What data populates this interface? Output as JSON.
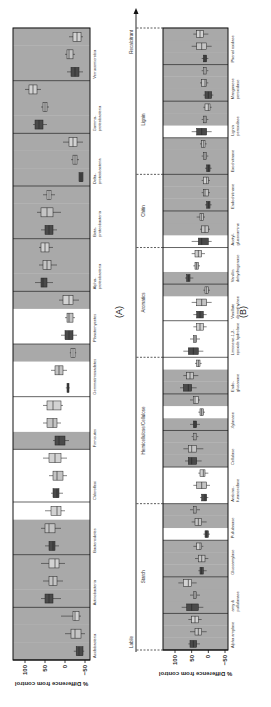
{
  "figure": {
    "panel_a_label": "(A)",
    "panel_b_label": "(B)",
    "gradient": {
      "low_label": "Labile",
      "high_label": "Recalcitrant"
    }
  },
  "colors": {
    "shaded_bg": "#a9a9a9",
    "unshaded_bg": "#ffffff",
    "treatment_1": "#4a4a4a",
    "treatment_2": "#c4c4c4",
    "treatment_3": "#d2d2d2"
  },
  "chart_data": [
    {
      "type": "box",
      "panel": "A",
      "ylabel": "% Difference from control",
      "ylim": [
        -60,
        110
      ],
      "yticks": [
        100,
        50,
        0,
        -50
      ],
      "ytick_labels": [
        "100",
        "50",
        "0",
        "−50"
      ],
      "categories": [
        {
          "label": "Acidobacteria",
          "shade": [
            1,
            1,
            1
          ],
          "boxes": [
            [
              -35,
              -45,
              -28,
              -48,
              -22
            ],
            [
              -25,
              -40,
              -15,
              -50,
              0
            ],
            [
              -25,
              -35,
              -20,
              -40,
              10
            ]
          ]
        },
        {
          "label": "Actinobacteria",
          "shade": [
            1,
            1,
            1
          ],
          "boxes": [
            [
              40,
              30,
              50,
              10,
              60
            ],
            [
              30,
              20,
              40,
              5,
              55
            ],
            [
              25,
              15,
              40,
              0,
              60
            ]
          ]
        },
        {
          "label": "Bacteroidetes",
          "shade": [
            1,
            1,
            0
          ],
          "boxes": [
            [
              30,
              25,
              40,
              15,
              50
            ],
            [
              40,
              25,
              50,
              10,
              60
            ],
            [
              20,
              10,
              35,
              0,
              50
            ]
          ]
        },
        {
          "label": "Chloroflexi",
          "shade": [
            0,
            0,
            0
          ],
          "boxes": [
            [
              20,
              15,
              30,
              5,
              35
            ],
            [
              20,
              5,
              30,
              -5,
              40
            ],
            [
              25,
              10,
              40,
              -5,
              55
            ]
          ]
        },
        {
          "label": "Firmicutes",
          "shade": [
            1,
            0,
            0
          ],
          "boxes": [
            [
              15,
              0,
              25,
              -10,
              30
            ],
            [
              30,
              20,
              45,
              10,
              55
            ],
            [
              30,
              10,
              45,
              5,
              55
            ]
          ]
        },
        {
          "label": "Gemmatimonadetes",
          "shade": [
            0,
            0,
            1
          ],
          "boxes": [
            [
              -8,
              -10,
              -5,
              -12,
              -2
            ],
            [
              15,
              5,
              25,
              -5,
              35
            ],
            [
              -20,
              -25,
              -15,
              -28,
              -12
            ]
          ]
        },
        {
          "label": "Planctomycetes",
          "shade": [
            0,
            0,
            1
          ],
          "boxes": [
            [
              -10,
              -20,
              0,
              -30,
              10
            ],
            [
              -10,
              -20,
              -5,
              -25,
              0
            ],
            [
              -10,
              -20,
              5,
              -35,
              15
            ]
          ]
        },
        {
          "label": "Alpha-\nproteobacteria",
          "shade": [
            1,
            1,
            1
          ],
          "boxes": [
            [
              55,
              45,
              60,
              30,
              75
            ],
            [
              45,
              35,
              55,
              20,
              65
            ],
            [
              50,
              40,
              60,
              30,
              65
            ]
          ]
        },
        {
          "label": "Beta-\nproteobacteria",
          "shade": [
            1,
            1,
            1
          ],
          "boxes": [
            [
              40,
              30,
              50,
              20,
              60
            ],
            [
              45,
              30,
              60,
              10,
              70
            ],
            [
              40,
              35,
              45,
              25,
              55
            ]
          ]
        },
        {
          "label": "Delta-\nproteobacteria",
          "shade": [
            1,
            1,
            1
          ],
          "boxes": [
            [
              -40,
              -45,
              -35,
              -45,
              -35
            ],
            [
              -25,
              -30,
              -20,
              -35,
              -15
            ],
            [
              -20,
              -30,
              -10,
              -45,
              5
            ]
          ]
        },
        {
          "label": "Gamma-\nproteobacteria",
          "shade": [
            1,
            1,
            1
          ],
          "boxes": [
            [
              65,
              55,
              75,
              45,
              80
            ],
            [
              50,
              45,
              55,
              40,
              60
            ],
            [
              80,
              70,
              90,
              60,
              100
            ]
          ]
        },
        {
          "label": "Verrucomicrobia",
          "shade": [
            1,
            1,
            1
          ],
          "boxes": [
            [
              -25,
              -35,
              -15,
              -45,
              -5
            ],
            [
              -10,
              -20,
              -5,
              -25,
              0
            ],
            [
              -30,
              -40,
              -20,
              -45,
              -10
            ]
          ]
        }
      ]
    },
    {
      "type": "box",
      "panel": "B",
      "ylabel": "% Difference from control",
      "ylim": [
        -60,
        110
      ],
      "yticks": [
        100,
        50,
        0,
        -50
      ],
      "ytick_labels": [
        "100",
        "50",
        "0",
        "−50"
      ],
      "groups": [
        {
          "label": "Starch",
          "span": [
            0,
            3
          ]
        },
        {
          "label": "Hemicellulose/Cellulose",
          "span": [
            4,
            7
          ]
        },
        {
          "label": "Aromatics",
          "span": [
            8,
            10
          ]
        },
        {
          "label": "Chitin",
          "span": [
            11,
            12
          ]
        },
        {
          "label": "Lignin",
          "span": [
            13,
            15
          ]
        }
      ],
      "categories": [
        {
          "label": "Alpha amylase",
          "shade": [
            1,
            1,
            1
          ],
          "boxes": [
            [
              45,
              35,
              55,
              25,
              60
            ],
            [
              30,
              20,
              40,
              5,
              55
            ],
            [
              40,
              30,
              50,
              20,
              60
            ]
          ]
        },
        {
          "label": "amy &\npullulanase",
          "shade": [
            1,
            1,
            1
          ],
          "boxes": [
            [
              50,
              30,
              65,
              15,
              80
            ],
            [
              40,
              35,
              45,
              25,
              55
            ],
            [
              60,
              50,
              75,
              35,
              90
            ]
          ]
        },
        {
          "label": "Glucoamylase",
          "shade": [
            1,
            1,
            1
          ],
          "boxes": [
            [
              20,
              15,
              25,
              5,
              30
            ],
            [
              20,
              10,
              30,
              0,
              40
            ],
            [
              25,
              20,
              35,
              15,
              45
            ]
          ]
        },
        {
          "label": "Pullulanase",
          "shade": [
            0,
            1,
            1
          ],
          "boxes": [
            [
              5,
              0,
              10,
              -5,
              15
            ],
            [
              30,
              20,
              40,
              5,
              50
            ],
            [
              40,
              35,
              45,
              25,
              55
            ]
          ]
        },
        {
          "label": "Arabino-\nfuranosidase",
          "shade": [
            0,
            0,
            0
          ],
          "boxes": [
            [
              10,
              5,
              20,
              0,
              25
            ],
            [
              20,
              5,
              35,
              -5,
              45
            ],
            [
              15,
              10,
              25,
              0,
              30
            ]
          ]
        },
        {
          "label": "Cellulase",
          "shade": [
            1,
            1,
            1
          ],
          "boxes": [
            [
              50,
              35,
              60,
              20,
              70
            ],
            [
              50,
              35,
              60,
              15,
              75
            ],
            [
              40,
              35,
              45,
              30,
              50
            ]
          ]
        },
        {
          "label": "Xylanase",
          "shade": [
            1,
            0,
            1
          ],
          "boxes": [
            [
              40,
              35,
              45,
              25,
              55
            ],
            [
              20,
              15,
              25,
              10,
              30
            ],
            [
              40,
              30,
              45,
              25,
              55
            ]
          ]
        },
        {
          "label": "Endo-\nglucanase",
          "shade": [
            1,
            1,
            0
          ],
          "boxes": [
            [
              60,
              50,
              75,
              35,
              85
            ],
            [
              55,
              45,
              65,
              30,
              75
            ],
            [
              30,
              25,
              35,
              20,
              40
            ]
          ]
        },
        {
          "label": "Limonene-1,2-\nepoxide hydrolase",
          "shade": [
            0,
            0,
            0
          ],
          "boxes": [
            [
              45,
              30,
              60,
              15,
              75
            ],
            [
              40,
              35,
              45,
              25,
              55
            ],
            [
              25,
              15,
              35,
              5,
              45
            ]
          ]
        },
        {
          "label": "Vanillate\ndemethylase",
          "shade": [
            0,
            0,
            1
          ],
          "boxes": [
            [
              25,
              15,
              35,
              5,
              45
            ],
            [
              20,
              5,
              35,
              -10,
              50
            ],
            [
              5,
              0,
              10,
              -5,
              15
            ]
          ]
        },
        {
          "label": "Vanillin\ndehydrogenase",
          "shade": [
            1,
            0,
            0
          ],
          "boxes": [
            [
              60,
              55,
              65,
              45,
              70
            ],
            [
              35,
              30,
              40,
              25,
              45
            ],
            [
              30,
              20,
              40,
              10,
              50
            ]
          ]
        },
        {
          "label": "Acetyl-\nglucosamine",
          "shade": [
            0,
            1,
            1
          ],
          "boxes": [
            [
              20,
              0,
              30,
              -10,
              50
            ],
            [
              10,
              0,
              20,
              -5,
              25
            ],
            [
              20,
              15,
              25,
              10,
              35
            ]
          ]
        },
        {
          "label": "Endochitinase",
          "shade": [
            1,
            1,
            1
          ],
          "boxes": [
            [
              0,
              -5,
              5,
              -10,
              10
            ],
            [
              10,
              0,
              15,
              -5,
              20
            ],
            [
              5,
              0,
              15,
              -5,
              20
            ]
          ]
        },
        {
          "label": "Exochitinase",
          "shade": [
            1,
            1,
            1
          ],
          "boxes": [
            [
              0,
              -5,
              5,
              -10,
              10
            ],
            [
              10,
              5,
              15,
              0,
              20
            ],
            [
              15,
              10,
              20,
              5,
              25
            ]
          ]
        },
        {
          "label": "Lignin\nperoxidase",
          "shade": [
            0,
            1,
            1
          ],
          "boxes": [
            [
              20,
              5,
              35,
              -10,
              50
            ],
            [
              10,
              5,
              15,
              0,
              20
            ],
            [
              0,
              -5,
              10,
              -10,
              15
            ]
          ]
        },
        {
          "label": "Manganese\nperoxidase",
          "shade": [
            1,
            1,
            1
          ],
          "boxes": [
            [
              0,
              -10,
              10,
              -15,
              15
            ],
            [
              10,
              5,
              20,
              0,
              25
            ],
            [
              10,
              5,
              15,
              0,
              20
            ]
          ]
        },
        {
          "label": "Phenol oxidase",
          "shade": [
            1,
            1,
            1
          ],
          "boxes": [
            [
              10,
              5,
              15,
              0,
              20
            ],
            [
              20,
              5,
              35,
              -10,
              50
            ],
            [
              25,
              15,
              35,
              0,
              45
            ]
          ]
        }
      ]
    }
  ]
}
